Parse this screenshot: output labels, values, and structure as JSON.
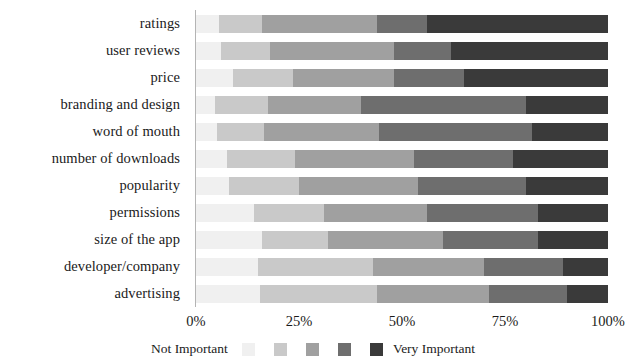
{
  "chart_data": {
    "type": "bar",
    "orientation": "horizontal",
    "stacked": true,
    "normalized_percent": true,
    "title": "",
    "xlabel": "",
    "ylabel": "",
    "xlim": [
      0,
      100
    ],
    "grid": false,
    "legend_position": "bottom",
    "legend_left_label": "Not Important",
    "legend_right_label": "Very Important",
    "legend_entries": [
      "1",
      "2",
      "3",
      "4",
      "5"
    ],
    "xticks": [
      "0%",
      "25%",
      "50%",
      "75%",
      "100%"
    ],
    "xtick_values": [
      0,
      25,
      50,
      75,
      100
    ],
    "categories": [
      "ratings",
      "user reviews",
      "price",
      "branding and design",
      "word of mouth",
      "number of downloads",
      "popularity",
      "permissions",
      "size of the app",
      "developer/company",
      "advertising"
    ],
    "series": [
      {
        "name": "Not Important",
        "color": "#f0f0f0",
        "values": [
          5.5,
          6.0,
          9.0,
          4.5,
          5.0,
          7.5,
          8.0,
          14.0,
          16.0,
          15.0,
          15.5
        ]
      },
      {
        "name": "2",
        "color": "#c9c9c9",
        "values": [
          10.5,
          12.0,
          14.5,
          13.0,
          11.5,
          16.5,
          17.0,
          17.0,
          16.0,
          28.0,
          28.5
        ]
      },
      {
        "name": "3",
        "color": "#a0a0a0",
        "values": [
          28.0,
          30.0,
          24.5,
          22.5,
          28.0,
          29.0,
          29.0,
          25.0,
          28.0,
          27.0,
          27.0
        ]
      },
      {
        "name": "4",
        "color": "#6e6e6e",
        "values": [
          12.0,
          14.0,
          17.0,
          40.0,
          37.0,
          24.0,
          26.0,
          27.0,
          23.0,
          19.0,
          19.0
        ]
      },
      {
        "name": "Very Important",
        "color": "#3a3a3a",
        "values": [
          44.0,
          38.0,
          35.0,
          20.0,
          18.5,
          23.0,
          20.0,
          17.0,
          17.0,
          11.0,
          10.0
        ]
      }
    ]
  }
}
